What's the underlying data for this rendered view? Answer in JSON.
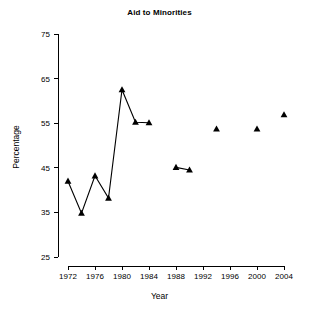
{
  "chart_data": {
    "type": "line",
    "title": "Aid to Minorities",
    "xlabel": "Year",
    "ylabel": "Percentage",
    "xlim": [
      1971,
      2005
    ],
    "ylim": [
      25,
      75
    ],
    "xticks": [
      1972,
      1976,
      1980,
      1984,
      1988,
      1992,
      1996,
      2000,
      2004
    ],
    "yticks": [
      25,
      35,
      45,
      55,
      65,
      75
    ],
    "grid": false,
    "legend": "none",
    "marker": "triangle",
    "series": [
      {
        "name": "Aid to Minorities",
        "points": [
          {
            "x": 1972,
            "y": 42.0
          },
          {
            "x": 1974,
            "y": 34.8
          },
          {
            "x": 1976,
            "y": 43.2
          },
          {
            "x": 1978,
            "y": 38.2
          },
          {
            "x": 1980,
            "y": 62.5
          },
          {
            "x": 1982,
            "y": 55.2
          },
          {
            "x": 1984,
            "y": 55.1
          }
        ]
      },
      {
        "name": "Aid to Minorities",
        "points": [
          {
            "x": 1988,
            "y": 45.1
          },
          {
            "x": 1990,
            "y": 44.5
          }
        ]
      },
      {
        "name": "Aid to Minorities",
        "points": [
          {
            "x": 1994,
            "y": 53.7
          }
        ]
      },
      {
        "name": "Aid to Minorities",
        "points": [
          {
            "x": 2000,
            "y": 53.7
          }
        ]
      },
      {
        "name": "Aid to Minorities",
        "points": [
          {
            "x": 2004,
            "y": 56.9
          }
        ]
      }
    ]
  }
}
